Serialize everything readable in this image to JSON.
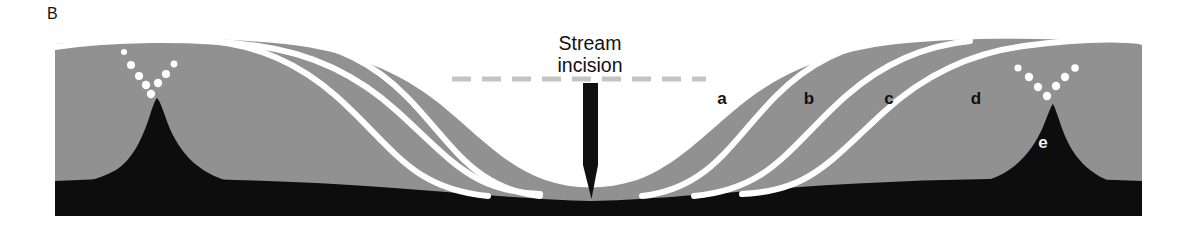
{
  "figure": {
    "panel_letter": "B",
    "width": 1182,
    "height": 234,
    "background_color": "#ffffff"
  },
  "annotations": {
    "stream_incision_line1": "Stream",
    "stream_incision_line2": "incision",
    "arrow_name": "downward-incision-arrow"
  },
  "unit_labels": [
    {
      "label": "a",
      "x": 722,
      "y": 104,
      "style": "dark"
    },
    {
      "label": "b",
      "x": 809,
      "y": 104,
      "style": "dark"
    },
    {
      "label": "c",
      "x": 889,
      "y": 104,
      "style": "dark"
    },
    {
      "label": "d",
      "x": 976,
      "y": 104,
      "style": "dark"
    },
    {
      "label": "e",
      "x": 1043,
      "y": 148,
      "style": "light"
    }
  ],
  "colors": {
    "regolith_gray": "#919191",
    "bedrock_black": "#0d0d0d",
    "layer_line_white": "#ffffff",
    "dashed_datum_gray": "#c4c4c4",
    "page_white": "#ffffff",
    "text_dark": "#121212",
    "text_light": "#f2f2f2"
  },
  "legend_description": {
    "regolith": "gray regolith / soil mantle",
    "bedrock": "black bedrock core and basal layer",
    "white_curves": "white lines marking successive weathering-front / soil-layer boundaries",
    "dashed_line": "dashed gray line marking former land surface datum across valley",
    "dot_clusters": "white stipple dots above each bedrock peak"
  }
}
